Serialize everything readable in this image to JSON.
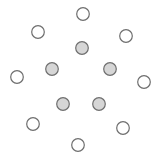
{
  "diagram": {
    "width": 160,
    "height": 162,
    "background": "#ffffff",
    "stroke_color": "#6e6e6e",
    "stroke_width": 1.2,
    "radius": 6.3,
    "styles": {
      "outer": {
        "fill": "#ffffff"
      },
      "inner": {
        "fill": "#d6d6d6"
      }
    },
    "nodes": [
      {
        "id": "outer-1",
        "group": "outer",
        "cx": 83,
        "cy": 14
      },
      {
        "id": "outer-2",
        "group": "outer",
        "cx": 38,
        "cy": 32
      },
      {
        "id": "outer-3",
        "group": "outer",
        "cx": 126,
        "cy": 36
      },
      {
        "id": "outer-4",
        "group": "outer",
        "cx": 17,
        "cy": 77
      },
      {
        "id": "outer-5",
        "group": "outer",
        "cx": 144,
        "cy": 82
      },
      {
        "id": "outer-6",
        "group": "outer",
        "cx": 33,
        "cy": 124
      },
      {
        "id": "outer-7",
        "group": "outer",
        "cx": 123,
        "cy": 128
      },
      {
        "id": "outer-8",
        "group": "outer",
        "cx": 78,
        "cy": 145
      },
      {
        "id": "inner-1",
        "group": "inner",
        "cx": 82,
        "cy": 48
      },
      {
        "id": "inner-2",
        "group": "inner",
        "cx": 52,
        "cy": 69
      },
      {
        "id": "inner-3",
        "group": "inner",
        "cx": 110,
        "cy": 69
      },
      {
        "id": "inner-4",
        "group": "inner",
        "cx": 63,
        "cy": 104
      },
      {
        "id": "inner-5",
        "group": "inner",
        "cx": 99,
        "cy": 104
      }
    ]
  }
}
